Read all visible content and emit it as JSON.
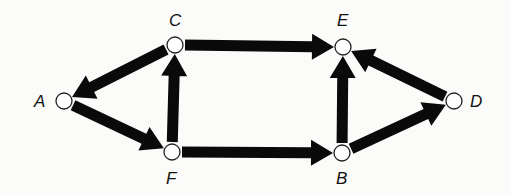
{
  "diagram": {
    "type": "directed-graph",
    "nodes": [
      {
        "id": "A",
        "label": "A",
        "x": 64,
        "y": 101,
        "label_x": 34,
        "label_y": 93
      },
      {
        "id": "C",
        "label": "C",
        "x": 175,
        "y": 45,
        "label_x": 169,
        "label_y": 12
      },
      {
        "id": "F",
        "label": "F",
        "x": 172,
        "y": 152,
        "label_x": 166,
        "label_y": 170
      },
      {
        "id": "E",
        "label": "E",
        "x": 343,
        "y": 47,
        "label_x": 337,
        "label_y": 12
      },
      {
        "id": "B",
        "label": "B",
        "x": 342,
        "y": 153,
        "label_x": 336,
        "label_y": 170
      },
      {
        "id": "D",
        "label": "D",
        "x": 454,
        "y": 101,
        "label_x": 470,
        "label_y": 93
      }
    ],
    "edges": [
      {
        "from": "C",
        "to": "A"
      },
      {
        "from": "A",
        "to": "F"
      },
      {
        "from": "F",
        "to": "C"
      },
      {
        "from": "C",
        "to": "E"
      },
      {
        "from": "F",
        "to": "B"
      },
      {
        "from": "B",
        "to": "E"
      },
      {
        "from": "B",
        "to": "D"
      },
      {
        "from": "D",
        "to": "E"
      }
    ],
    "colors": {
      "edge": "#0a0a0a",
      "node_fill": "#ffffff",
      "node_stroke": "#222222",
      "background": "#fbfbfa"
    }
  }
}
